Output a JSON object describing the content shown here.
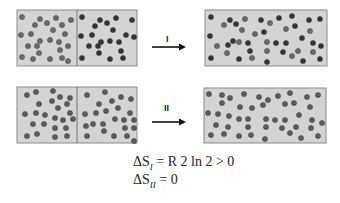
{
  "colors": {
    "box_fill": "#d4d4d4",
    "box_border": "#8a8a8a",
    "ball_gas_a": "#6b6b6b",
    "ball_gas_b": "#353535",
    "ball_same": "#5c5c5c",
    "arrow": "#111111"
  },
  "process_I": {
    "label": "I",
    "description": "Mixing of two different gases",
    "before": {
      "box": {
        "x": 17,
        "y": 10,
        "w": 120,
        "h": 56,
        "divider_x": 77
      },
      "left_balls": [
        [
          22,
          17
        ],
        [
          40,
          19
        ],
        [
          47,
          23
        ],
        [
          56,
          18
        ],
        [
          71,
          20
        ],
        [
          35,
          25
        ],
        [
          62,
          25
        ],
        [
          53,
          30
        ],
        [
          21,
          35
        ],
        [
          31,
          34
        ],
        [
          65,
          34
        ],
        [
          40,
          41
        ],
        [
          50,
          40
        ],
        [
          59,
          42
        ],
        [
          28,
          46
        ],
        [
          37,
          46
        ],
        [
          68,
          46
        ],
        [
          60,
          50
        ],
        [
          39,
          53
        ],
        [
          22,
          57
        ],
        [
          33,
          59
        ],
        [
          50,
          59
        ],
        [
          62,
          58
        ],
        [
          68,
          61
        ]
      ],
      "right_balls": [
        [
          82,
          17
        ],
        [
          100,
          20
        ],
        [
          116,
          18
        ],
        [
          132,
          20
        ],
        [
          95,
          26
        ],
        [
          107,
          23
        ],
        [
          113,
          30
        ],
        [
          81,
          36
        ],
        [
          92,
          35
        ],
        [
          126,
          35
        ],
        [
          134,
          37
        ],
        [
          101,
          42
        ],
        [
          110,
          41
        ],
        [
          119,
          42
        ],
        [
          89,
          46
        ],
        [
          98,
          46
        ],
        [
          121,
          51
        ],
        [
          99,
          53
        ],
        [
          82,
          58
        ],
        [
          110,
          59
        ],
        [
          123,
          58
        ]
      ]
    },
    "after": {
      "box": {
        "x": 205,
        "y": 10,
        "w": 122,
        "h": 56
      },
      "balls": [
        [
          211,
          17
        ],
        [
          224,
          25
        ],
        [
          230,
          20
        ],
        [
          236,
          24
        ],
        [
          245,
          19
        ],
        [
          261,
          20
        ],
        [
          270,
          23
        ],
        [
          279,
          18
        ],
        [
          292,
          16
        ],
        [
          309,
          20
        ],
        [
          320,
          19
        ],
        [
          242,
          30
        ],
        [
          255,
          34
        ],
        [
          264,
          32
        ],
        [
          286,
          29
        ],
        [
          295,
          26
        ],
        [
          310,
          31
        ],
        [
          210,
          36
        ],
        [
          217,
          46
        ],
        [
          228,
          45
        ],
        [
          233,
          41
        ],
        [
          239,
          42
        ],
        [
          248,
          43
        ],
        [
          267,
          42
        ],
        [
          276,
          43
        ],
        [
          286,
          43
        ],
        [
          302,
          38
        ],
        [
          313,
          43
        ],
        [
          321,
          46
        ],
        [
          227,
          53
        ],
        [
          250,
          51
        ],
        [
          267,
          51
        ],
        [
          283,
          52
        ],
        [
          298,
          51
        ],
        [
          313,
          52
        ],
        [
          211,
          58
        ],
        [
          239,
          59
        ],
        [
          252,
          58
        ],
        [
          267,
          62
        ],
        [
          292,
          56
        ],
        [
          303,
          61
        ],
        [
          320,
          59
        ]
      ],
      "dark_indices": [
        0,
        2,
        3,
        5,
        7,
        8,
        9,
        10,
        13,
        15,
        17,
        19,
        20,
        22,
        24,
        25,
        26,
        27,
        28,
        30,
        32,
        35,
        36,
        38,
        40,
        41
      ]
    }
  },
  "process_II": {
    "label": "II",
    "description": "Mixing of identical gases",
    "before": {
      "box": {
        "x": 17,
        "y": 87,
        "w": 120,
        "h": 56,
        "divider_x": 77
      },
      "left_balls": [
        [
          27,
          95
        ],
        [
          36,
          92
        ],
        [
          53,
          91
        ],
        [
          60,
          97
        ],
        [
          70,
          98
        ],
        [
          39,
          104
        ],
        [
          52,
          101
        ],
        [
          58,
          108
        ],
        [
          67,
          104
        ],
        [
          25,
          114
        ],
        [
          36,
          113
        ],
        [
          45,
          115
        ],
        [
          55,
          118
        ],
        [
          63,
          120
        ],
        [
          73,
          119
        ],
        [
          33,
          124
        ],
        [
          44,
          124
        ],
        [
          55,
          128
        ],
        [
          66,
          128
        ],
        [
          27,
          136
        ],
        [
          37,
          134
        ],
        [
          55,
          137
        ],
        [
          67,
          136
        ],
        [
          70,
          113
        ]
      ],
      "right_balls": [
        [
          87,
          95
        ],
        [
          105,
          92
        ],
        [
          112,
          101
        ],
        [
          121,
          97
        ],
        [
          131,
          99
        ],
        [
          99,
          104
        ],
        [
          106,
          111
        ],
        [
          118,
          108
        ],
        [
          85,
          114
        ],
        [
          96,
          113
        ],
        [
          130,
          113
        ],
        [
          115,
          119
        ],
        [
          124,
          120
        ],
        [
          134,
          120
        ],
        [
          86,
          126
        ],
        [
          93,
          124
        ],
        [
          103,
          124
        ],
        [
          125,
          128
        ],
        [
          134,
          128
        ],
        [
          104,
          131
        ],
        [
          87,
          136
        ],
        [
          114,
          136
        ],
        [
          127,
          136
        ],
        [
          134,
          141
        ]
      ]
    },
    "after": {
      "box": {
        "x": 204,
        "y": 88,
        "w": 122,
        "h": 55
      },
      "balls": [
        [
          209,
          94
        ],
        [
          222,
          95
        ],
        [
          230,
          98
        ],
        [
          244,
          94
        ],
        [
          259,
          97
        ],
        [
          268,
          100
        ],
        [
          278,
          96
        ],
        [
          290,
          93
        ],
        [
          307,
          97
        ],
        [
          318,
          95
        ],
        [
          222,
          103
        ],
        [
          240,
          107
        ],
        [
          252,
          108
        ],
        [
          263,
          105
        ],
        [
          285,
          104
        ],
        [
          294,
          103
        ],
        [
          310,
          107
        ],
        [
          208,
          113
        ],
        [
          218,
          114
        ],
        [
          229,
          116
        ],
        [
          239,
          119
        ],
        [
          248,
          119
        ],
        [
          266,
          119
        ],
        [
          275,
          120
        ],
        [
          285,
          120
        ],
        [
          299,
          115
        ],
        [
          312,
          120
        ],
        [
          322,
          123
        ],
        [
          216,
          125
        ],
        [
          228,
          127
        ],
        [
          248,
          127
        ],
        [
          266,
          127
        ],
        [
          282,
          128
        ],
        [
          296,
          127
        ],
        [
          311,
          128
        ],
        [
          211,
          135
        ],
        [
          224,
          134
        ],
        [
          239,
          136
        ],
        [
          251,
          135
        ],
        [
          265,
          139
        ],
        [
          290,
          133
        ],
        [
          301,
          138
        ],
        [
          318,
          136
        ]
      ]
    }
  },
  "arrows": [
    {
      "id": "I",
      "x1": 152,
      "x2": 186,
      "y": 47,
      "label_x": 166,
      "label_y": 34
    },
    {
      "id": "II",
      "x1": 152,
      "x2": 186,
      "y": 122,
      "label_x": 164,
      "label_y": 103
    }
  ],
  "equations": [
    {
      "delta": "ΔS",
      "sub": "I",
      "rhs": "= R 2 ln 2 > 0"
    },
    {
      "delta": "ΔS",
      "sub": "II",
      "rhs": "= 0"
    }
  ]
}
